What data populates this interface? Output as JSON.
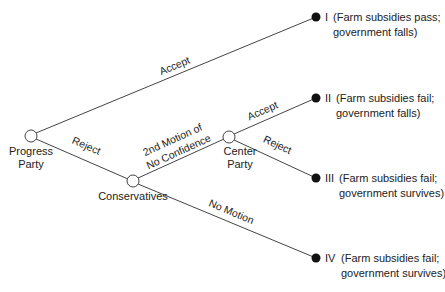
{
  "diagram": {
    "type": "game-tree",
    "nodes": {
      "progress": {
        "label_line1": "Progress",
        "label_line2": "Party"
      },
      "conservatives": {
        "label": "Conservatives"
      },
      "center": {
        "label_line1": "Center",
        "label_line2": "Party"
      }
    },
    "edges": {
      "progress_accept": "Accept",
      "progress_reject": "Reject",
      "cons_motion_line1": "2nd Motion of",
      "cons_motion_line2": "No Confidence",
      "cons_nomotion": "No Motion",
      "center_accept": "Accept",
      "center_reject": "Reject"
    },
    "outcomes": [
      {
        "numeral": "I",
        "line1": "(Farm subsidies pass;",
        "line2": "government falls)"
      },
      {
        "numeral": "II",
        "line1": "(Farm subsidies fail;",
        "line2": "government falls)"
      },
      {
        "numeral": "III",
        "line1": "(Farm subsidies fail;",
        "line2": "government survives)"
      },
      {
        "numeral": "IV",
        "line1": "(Farm subsidies fail;",
        "line2": "government survives)"
      }
    ]
  }
}
